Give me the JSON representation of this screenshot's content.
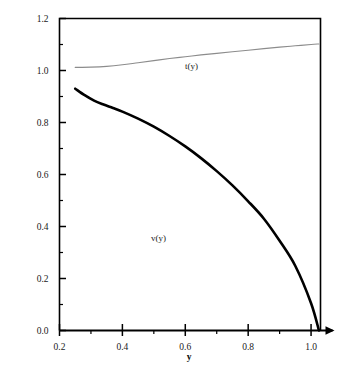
{
  "chart_data": {
    "type": "line",
    "title": "",
    "subtitle": "",
    "xlabel": "y",
    "ylabel": "",
    "xlim": [
      0.2,
      1.03
    ],
    "ylim": [
      0.0,
      1.2
    ],
    "grid": false,
    "legend_position": "inline-annotation",
    "x_ticks": [
      "0.2",
      "0.4",
      "0.6",
      "0.8",
      "1.0"
    ],
    "x_tick_values": [
      0.2,
      0.4,
      0.6,
      0.8,
      1.0
    ],
    "x_minor_tick_values": [
      0.3,
      0.5,
      0.7,
      0.9
    ],
    "y_ticks": [
      "0.0",
      "0.2",
      "0.4",
      "0.6",
      "0.8",
      "1.0",
      "1.2"
    ],
    "y_tick_values": [
      0.0,
      0.2,
      0.4,
      0.6,
      0.8,
      1.0,
      1.2
    ],
    "y_minor_tick_values": [
      0.1,
      0.3,
      0.5,
      0.7,
      0.9,
      1.1
    ],
    "series": [
      {
        "name": "t(y)",
        "label": "t(y)",
        "color": "#8c8c8c",
        "width": 1.1,
        "x": [
          0.25,
          0.3,
          0.35,
          0.4,
          0.45,
          0.5,
          0.55,
          0.6,
          0.65,
          0.7,
          0.75,
          0.8,
          0.85,
          0.9,
          0.95,
          1.0,
          1.025
        ],
        "values": [
          1.012,
          1.013,
          1.016,
          1.022,
          1.03,
          1.038,
          1.046,
          1.053,
          1.06,
          1.066,
          1.072,
          1.078,
          1.084,
          1.09,
          1.095,
          1.1,
          1.102
        ]
      },
      {
        "name": "v(y)",
        "label": "v(y)",
        "color": "#000000",
        "width": 2.6,
        "x": [
          0.25,
          0.28,
          0.31,
          0.34,
          0.37,
          0.4,
          0.45,
          0.5,
          0.55,
          0.6,
          0.65,
          0.7,
          0.75,
          0.8,
          0.85,
          0.9,
          0.95,
          1.0,
          1.025
        ],
        "values": [
          0.93,
          0.905,
          0.884,
          0.869,
          0.856,
          0.842,
          0.815,
          0.784,
          0.748,
          0.708,
          0.663,
          0.613,
          0.558,
          0.497,
          0.43,
          0.345,
          0.248,
          0.105,
          0.0
        ]
      }
    ],
    "annotations": [
      {
        "text": "t(y)",
        "x": 0.62,
        "y": 1.005,
        "series": "t(y)"
      },
      {
        "text": "v(y)",
        "x": 0.515,
        "y": 0.345,
        "series": "v(y)"
      }
    ],
    "axis_color": "#000000",
    "background": "#ffffff"
  }
}
